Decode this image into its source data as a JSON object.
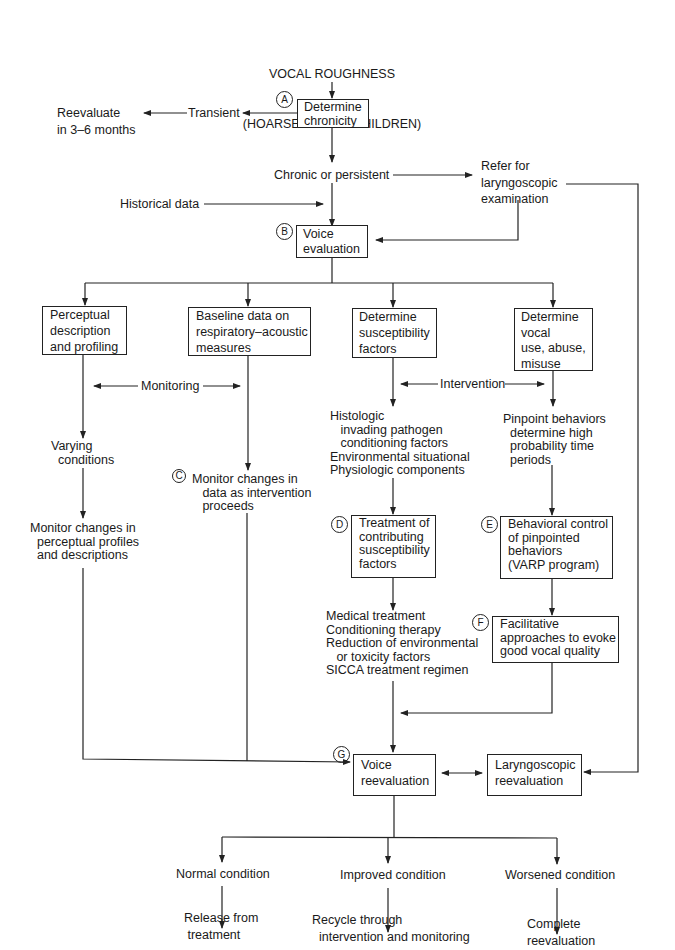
{
  "diagram": {
    "title_line1": "VOCAL ROUGHNESS",
    "title_line2": "(HOARSENESS IN CHILDREN)",
    "markers": {
      "a": "A",
      "b": "B",
      "c": "C",
      "d": "D",
      "e": "E",
      "f": "F",
      "g": "G"
    },
    "nodes": {
      "determine_chronicity": "Determine\nchronicity",
      "transient": "Transient",
      "reevaluate_3_6": "Reevaluate\nin 3–6 months",
      "chronic_persistent": "Chronic or persistent",
      "refer_laryngoscopic": "Refer for\nlaryngoscopic\nexamination",
      "historical_data": "Historical data",
      "voice_evaluation": "Voice\nevaluation",
      "perceptual": "Perceptual\ndescription\nand profiling",
      "baseline": "Baseline data on\nrespiratory–acoustic\nmeasures",
      "susceptibility": "Determine\nsusceptibility\nfactors",
      "vocal_use": "Determine\nvocal\nuse, abuse,\nmisuse",
      "monitoring": "Monitoring",
      "intervention": "Intervention",
      "varying_conditions": "Varying\n  conditions",
      "monitor_data": "Monitor changes in\n   data as intervention\n   proceeds",
      "monitor_perceptual": "Monitor changes in\n  perceptual profiles\n  and descriptions",
      "histologic": "Histologic\n   invading pathogen\n   conditioning factors\nEnvironmental situational\nPhysiologic components",
      "pinpoint": "Pinpoint behaviors\n  determine high\n  probability time\n  periods",
      "treatment_contributing": "Treatment of\ncontributing\nsusceptibility\nfactors",
      "behavioral_control": "Behavioral control\nof pinpointed\nbehaviors\n(VARP program)",
      "medical_treatment": "Medical treatment\nConditioning therapy\nReduction of environmental\n   or toxicity factors\nSICCA treatment regimen",
      "facilitative": "Facilitative\napproaches to evoke\ngood vocal quality",
      "voice_reevaluation": "Voice\nreevaluation",
      "laryngoscopic_reevaluation": "Laryngoscopic\nreevaluation",
      "normal_condition": "Normal condition",
      "improved_condition": "Improved condition",
      "worsened_condition": "Worsened condition",
      "release": "Release from\n treatment",
      "recycle": "Recycle through\n  intervention and monitoring",
      "complete_reevaluation": "Complete\nreevaluation"
    }
  }
}
